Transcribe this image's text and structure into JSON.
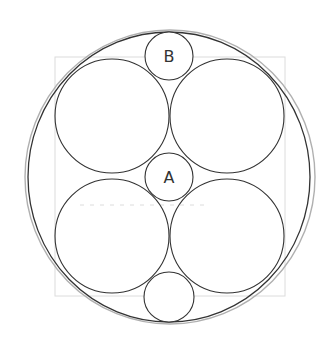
{
  "diagram": {
    "width": 331,
    "height": 345,
    "colors": {
      "background": "#ffffff",
      "stroke_dark": "#333333",
      "stroke_outer": "#b0b0b0",
      "guide": "#dcdcdc",
      "label": "#333333"
    },
    "outer_circles": [
      {
        "name": "outer-circle-light",
        "cx": 170,
        "cy": 177,
        "rx": 145,
        "ry": 147
      },
      {
        "name": "outer-circle-dark",
        "cx": 169,
        "cy": 177,
        "rx": 141,
        "ry": 145
      }
    ],
    "guide_rect": {
      "x": 55,
      "y": 57,
      "width": 230,
      "height": 239
    },
    "guide_dashed_line": {
      "x1": 80,
      "y1": 205,
      "x2": 205,
      "y2": 205
    },
    "large_circles": [
      {
        "name": "large-circle-top-left",
        "cx": 112,
        "cy": 116,
        "r": 57
      },
      {
        "name": "large-circle-top-right",
        "cx": 227,
        "cy": 116,
        "r": 57
      },
      {
        "name": "large-circle-bottom-left",
        "cx": 112,
        "cy": 236,
        "r": 57
      },
      {
        "name": "large-circle-bottom-right",
        "cx": 227,
        "cy": 236,
        "r": 57
      }
    ],
    "small_circles": [
      {
        "name": "small-circle-b",
        "cx": 169,
        "cy": 56,
        "r": 24,
        "label": "B"
      },
      {
        "name": "small-circle-a",
        "cx": 169,
        "cy": 177,
        "r": 24,
        "label": "A"
      },
      {
        "name": "small-circle-bottom",
        "cx": 169,
        "cy": 297,
        "r": 25,
        "label": ""
      }
    ]
  }
}
